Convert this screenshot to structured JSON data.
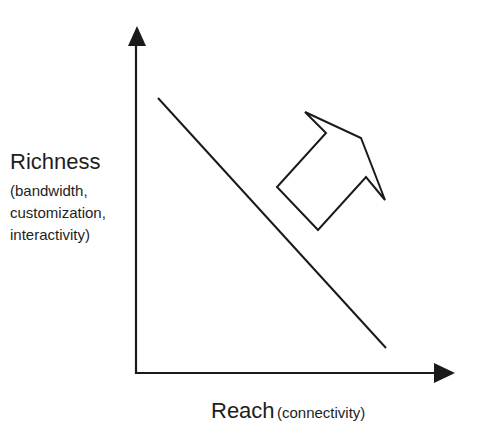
{
  "diagram": {
    "y_axis": {
      "title": "Richness",
      "subtitle_lines": [
        "(bandwidth,",
        "customization,",
        "interactivity)"
      ]
    },
    "x_axis": {
      "title": "Reach",
      "subtitle": "(connectivity)"
    },
    "elements": {
      "tradeoff_line": "diagonal line from upper-left to lower-right",
      "direction_arrow": "hollow block arrow pointing up-right"
    },
    "colors": {
      "stroke": "#1a1a1a",
      "background": "#ffffff"
    }
  }
}
